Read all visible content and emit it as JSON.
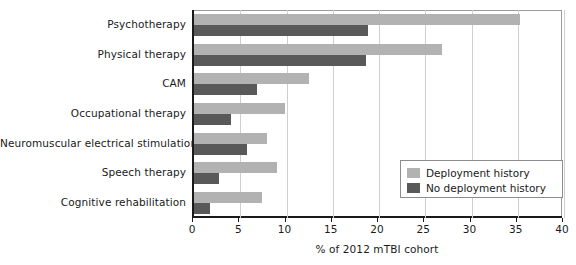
{
  "chart_data": {
    "type": "bar",
    "orientation": "horizontal",
    "title": "",
    "xlabel": "% of 2012 mTBI cohort",
    "ylabel": "",
    "xlim": [
      0,
      40
    ],
    "xticks": [
      0,
      5,
      10,
      15,
      20,
      25,
      30,
      35,
      40
    ],
    "grid": "vertical",
    "legend_position": "inside-right",
    "categories": [
      "Psychotherapy",
      "Physical therapy",
      "CAM",
      "Occupational therapy",
      "Neuromuscular electrical stimulation",
      "Speech therapy",
      "Cognitive rehabilitation"
    ],
    "series": [
      {
        "name": "Deployment history",
        "color": "#b2b2b2",
        "values": [
          35.2,
          26.8,
          12.4,
          9.8,
          7.9,
          9.0,
          7.4
        ]
      },
      {
        "name": "No deployment history",
        "color": "#595959",
        "values": [
          18.8,
          18.6,
          6.8,
          4.0,
          5.7,
          2.7,
          1.7
        ]
      }
    ]
  },
  "axis": {
    "x_title": "% of 2012 mTBI cohort",
    "tick_labels": [
      "0",
      "5",
      "10",
      "15",
      "20",
      "25",
      "30",
      "35",
      "40"
    ]
  },
  "legend": {
    "items": [
      {
        "label": "Deployment history",
        "color": "#b2b2b2"
      },
      {
        "label": "No deployment history",
        "color": "#595959"
      }
    ]
  },
  "colors": {
    "series_light": "#b2b2b2",
    "series_dark": "#595959",
    "axis": "#1a1a1a",
    "grid": "#cfcfcf",
    "background": "#ffffff"
  }
}
